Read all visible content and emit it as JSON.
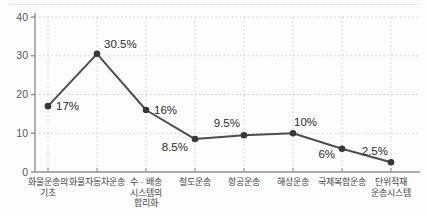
{
  "chart_data": {
    "type": "line",
    "title": "",
    "xlabel": "",
    "ylabel": "",
    "categories": [
      [
        "화물운송의",
        "기초"
      ],
      [
        "화물자동차운송"
      ],
      [
        "수 · 배송",
        "시스템의",
        "합리화"
      ],
      [
        "철도운송"
      ],
      [
        "항공운송"
      ],
      [
        "해상운송"
      ],
      [
        "국제복합운송"
      ],
      [
        "단위적재",
        "운송시스템"
      ]
    ],
    "values": [
      17,
      30.5,
      16,
      8.5,
      9.5,
      10,
      6,
      2.5
    ],
    "point_labels": [
      "17%",
      "30.5%",
      "16%",
      "8.5%",
      "9.5%",
      "10%",
      "6%",
      "2.5%"
    ],
    "ylim": [
      0,
      40
    ],
    "yticks": [
      "0",
      "10",
      "20",
      "30",
      "40"
    ],
    "ytick_values": [
      0,
      10,
      20,
      30,
      40
    ],
    "grid": true,
    "legend": "none",
    "colors": {
      "line": "#4d4d4d",
      "marker": "#383838",
      "grid": "#c9c9c9",
      "axis": "#8f8f8f",
      "point_label_text": "#2b2b2b",
      "tick_text": "#555555",
      "category_text": "#454545",
      "background": "#fdfdfd"
    }
  }
}
